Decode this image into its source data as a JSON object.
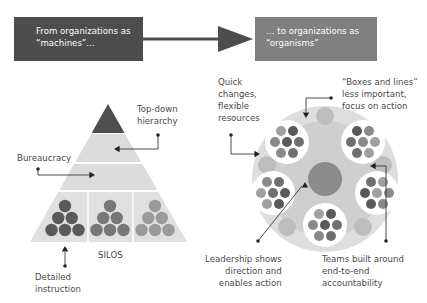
{
  "header": {
    "left_box": "From organizations as\n“machines”…",
    "right_box": "… to organizations as\n“organisms”",
    "left_box_color": "#4d4d4d",
    "right_box_color": "#808080",
    "arrow_color": "#4d4d4d"
  },
  "machine_diagram": {
    "labels": {
      "top_down": "Top-down\nhierarchy",
      "bureaucracy": "Bureaucracy",
      "silos": "SILOS",
      "detailed": "Detailed\ninstruction"
    },
    "colors": {
      "apex": "#4f4f4f",
      "band": "#dadada",
      "silo_dots": [
        "#5a5a5a",
        "#777777",
        "#9a9a9a"
      ]
    }
  },
  "organism_diagram": {
    "labels": {
      "quick_changes": "Quick\nchanges,\nflexible\nresources",
      "boxes_lines": "“Boxes and lines”\nless important,\nfocus on action",
      "leadership": "Leadership shows\ndirection and\nenables action",
      "teams": "Teams built around\nend-to-end\naccountability"
    },
    "colors": {
      "outer": "#d9d9d9",
      "team_circle": "#ffffff",
      "core": "#8c8c8c"
    }
  }
}
